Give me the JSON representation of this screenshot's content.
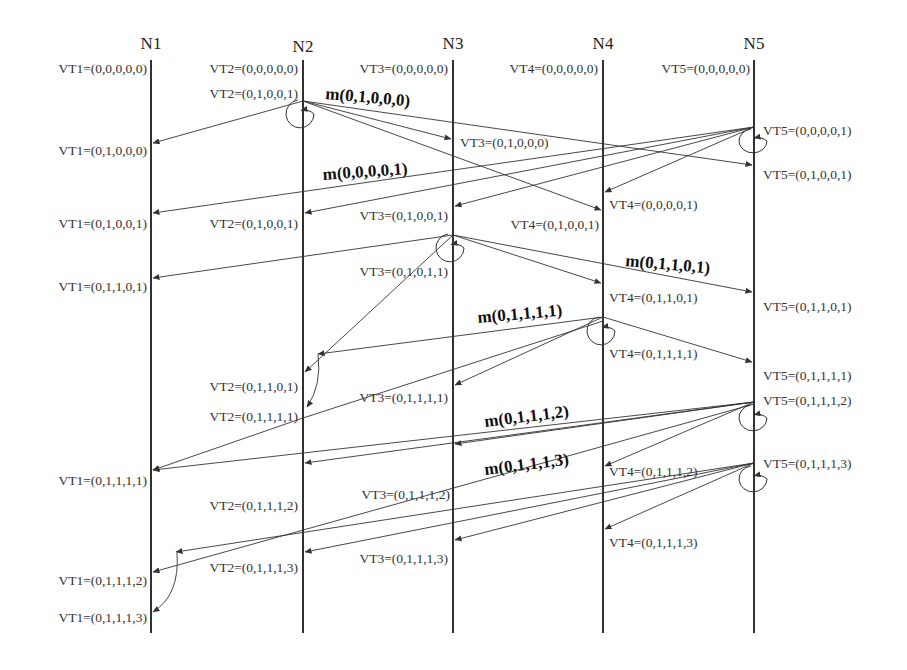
{
  "colors": {
    "line": "#1a1a1a",
    "arrow": "#333333",
    "text": "#333333",
    "background": "#ffffff"
  },
  "lifeline_top": 60,
  "lifeline_bottom": 633,
  "nodes": [
    {
      "id": "N1",
      "label": "N1",
      "x": 151,
      "label_y": 49
    },
    {
      "id": "N2",
      "label": "N2",
      "x": 303,
      "label_y": 52
    },
    {
      "id": "N3",
      "label": "N3",
      "x": 453,
      "label_y": 49
    },
    {
      "id": "N4",
      "label": "N4",
      "x": 603,
      "label_y": 49
    },
    {
      "id": "N5",
      "label": "N5",
      "x": 754,
      "label_y": 49
    }
  ],
  "vector_clock_labels": [
    {
      "node": "N1",
      "text": "VT1=(0,0,0,0,0)",
      "x": 147,
      "y": 73,
      "anchor": "end"
    },
    {
      "node": "N2",
      "text": "VT2=(0,0,0,0,0)",
      "x": 298,
      "y": 73,
      "anchor": "end"
    },
    {
      "node": "N3",
      "text": "VT3=(0,0,0,0,0)",
      "x": 448,
      "y": 73,
      "anchor": "end"
    },
    {
      "node": "N4",
      "text": "VT4=(0,0,0,0,0)",
      "x": 598,
      "y": 73,
      "anchor": "end"
    },
    {
      "node": "N5",
      "text": "VT5=(0,0,0,0,0)",
      "x": 750,
      "y": 73,
      "anchor": "end"
    },
    {
      "node": "N2",
      "text": "VT2=(0,1,0,0,1)",
      "x": 298,
      "y": 98,
      "anchor": "end"
    },
    {
      "node": "N1",
      "text": "VT1=(0,1,0,0,0)",
      "x": 147,
      "y": 155,
      "anchor": "end"
    },
    {
      "node": "N3",
      "text": "VT3=(0,1,0,0,0)",
      "x": 460,
      "y": 147,
      "anchor": "start"
    },
    {
      "node": "N5",
      "text": "VT5=(0,0,0,0,1)",
      "x": 763,
      "y": 135,
      "anchor": "start"
    },
    {
      "node": "N5",
      "text": "VT5=(0,1,0,0,1)",
      "x": 763,
      "y": 179,
      "anchor": "start"
    },
    {
      "node": "N4",
      "text": "VT4=(0,0,0,0,1)",
      "x": 609,
      "y": 209,
      "anchor": "start"
    },
    {
      "node": "N1",
      "text": "VT1=(0,1,0,0,1)",
      "x": 147,
      "y": 228,
      "anchor": "end"
    },
    {
      "node": "N2",
      "text": "VT2=(0,1,0,0,1)",
      "x": 298,
      "y": 228,
      "anchor": "end"
    },
    {
      "node": "N3",
      "text": "VT3=(0,1,0,0,1)",
      "x": 448,
      "y": 220,
      "anchor": "end"
    },
    {
      "node": "N4",
      "text": "VT4=(0,1,0,0,1)",
      "x": 599,
      "y": 229,
      "anchor": "end"
    },
    {
      "node": "N3",
      "text": "VT3=(0,1,0,1,1)",
      "x": 448,
      "y": 276,
      "anchor": "end"
    },
    {
      "node": "N1",
      "text": "VT1=(0,1,1,0,1)",
      "x": 147,
      "y": 291,
      "anchor": "end"
    },
    {
      "node": "N4",
      "text": "VT4=(0,1,1,0,1)",
      "x": 609,
      "y": 302,
      "anchor": "start"
    },
    {
      "node": "N5",
      "text": "VT5=(0,1,1,0,1)",
      "x": 763,
      "y": 311,
      "anchor": "start"
    },
    {
      "node": "N4",
      "text": "VT4=(0,1,1,1,1)",
      "x": 609,
      "y": 358,
      "anchor": "start"
    },
    {
      "node": "N5",
      "text": "VT5=(0,1,1,1,1)",
      "x": 763,
      "y": 380,
      "anchor": "start"
    },
    {
      "node": "N2",
      "text": "VT2=(0,1,1,0,1)",
      "x": 298,
      "y": 391,
      "anchor": "end"
    },
    {
      "node": "N5",
      "text": "VT5=(0,1,1,1,2)",
      "x": 763,
      "y": 405,
      "anchor": "start"
    },
    {
      "node": "N3",
      "text": "VT3=(0,1,1,1,1)",
      "x": 448,
      "y": 402,
      "anchor": "end"
    },
    {
      "node": "N2",
      "text": "VT2=(0,1,1,1,1)",
      "x": 298,
      "y": 421,
      "anchor": "end"
    },
    {
      "node": "N1",
      "text": "VT1=(0,1,1,1,1)",
      "x": 147,
      "y": 485,
      "anchor": "end"
    },
    {
      "node": "N4",
      "text": "VT4=(0,1,1,1,2)",
      "x": 609,
      "y": 476,
      "anchor": "start"
    },
    {
      "node": "N5",
      "text": "VT5=(0,1,1,1,3)",
      "x": 763,
      "y": 468,
      "anchor": "start"
    },
    {
      "node": "N3",
      "text": "VT3=(0,1,1,1,2)",
      "x": 450,
      "y": 499,
      "anchor": "end"
    },
    {
      "node": "N2",
      "text": "VT2=(0,1,1,1,2)",
      "x": 298,
      "y": 510,
      "anchor": "end"
    },
    {
      "node": "N4",
      "text": "VT4=(0,1,1,1,3)",
      "x": 609,
      "y": 547,
      "anchor": "start"
    },
    {
      "node": "N3",
      "text": "VT3=(0,1,1,1,3)",
      "x": 448,
      "y": 563,
      "anchor": "end"
    },
    {
      "node": "N2",
      "text": "VT2=(0,1,1,1,3)",
      "x": 298,
      "y": 572,
      "anchor": "end"
    },
    {
      "node": "N1",
      "text": "VT1=(0,1,1,1,2)",
      "x": 147,
      "y": 585,
      "anchor": "end"
    },
    {
      "node": "N1",
      "text": "VT1=(0,1,1,1,3)",
      "x": 147,
      "y": 622,
      "anchor": "end"
    }
  ],
  "message_labels": [
    {
      "text": "m(0,1,0,0,0)",
      "x": 325,
      "y": 99,
      "rotate": 5
    },
    {
      "text": "m(0,0,0,0,1)",
      "x": 323,
      "y": 180,
      "rotate": -4
    },
    {
      "text": "m(0,1,1,0,1)",
      "x": 625,
      "y": 266,
      "rotate": 5
    },
    {
      "text": "m(0,1,1,1,1)",
      "x": 478,
      "y": 323,
      "rotate": -5
    },
    {
      "text": "m(0,1,1,1,2)",
      "x": 485,
      "y": 427,
      "rotate": -7
    },
    {
      "text": "m(0,1,1,1,3)",
      "x": 485,
      "y": 475,
      "rotate": -7
    }
  ],
  "messages": [
    {
      "from": "N2",
      "to": "N1",
      "x1": 303,
      "y1": 101,
      "x2": 153,
      "y2": 143
    },
    {
      "from": "N2",
      "to": "N3",
      "x1": 303,
      "y1": 101,
      "x2": 451,
      "y2": 139
    },
    {
      "from": "N2",
      "to": "N4",
      "x1": 303,
      "y1": 101,
      "x2": 601,
      "y2": 210
    },
    {
      "from": "N2",
      "to": "N5",
      "x1": 303,
      "y1": 101,
      "x2": 752,
      "y2": 165
    },
    {
      "from": "N5",
      "to": "N1",
      "x1": 754,
      "y1": 127,
      "x2": 153,
      "y2": 213
    },
    {
      "from": "N5",
      "to": "N2",
      "x1": 754,
      "y1": 127,
      "x2": 305,
      "y2": 213
    },
    {
      "from": "N5",
      "to": "N3",
      "x1": 754,
      "y1": 127,
      "x2": 455,
      "y2": 206
    },
    {
      "from": "N5",
      "to": "N4",
      "x1": 754,
      "y1": 127,
      "x2": 605,
      "y2": 192
    },
    {
      "from": "N3",
      "to": "N1",
      "x1": 453,
      "y1": 235,
      "x2": 153,
      "y2": 278
    },
    {
      "from": "N3",
      "to": "N2",
      "x1": 453,
      "y1": 235,
      "x2": 305,
      "y2": 372
    },
    {
      "from": "N3",
      "to": "N4",
      "x1": 453,
      "y1": 235,
      "x2": 601,
      "y2": 283
    },
    {
      "from": "N3",
      "to": "N5",
      "x1": 453,
      "y1": 235,
      "x2": 752,
      "y2": 292
    },
    {
      "from": "N4",
      "to": "N2",
      "x1": 603,
      "y1": 317,
      "x2": 318,
      "y2": 354
    },
    {
      "from": "N4",
      "to": "N3",
      "x1": 603,
      "y1": 317,
      "x2": 455,
      "y2": 385
    },
    {
      "from": "N4",
      "to": "N5",
      "x1": 603,
      "y1": 317,
      "x2": 752,
      "y2": 362
    },
    {
      "from": "N4",
      "to": "N1",
      "x1": 603,
      "y1": 321,
      "x2": 303,
      "y2": 418,
      "continues_to": {
        "x": 153,
        "y": 470
      }
    },
    {
      "from": "N5",
      "to": "N1",
      "x1": 754,
      "y1": 402,
      "x2": 153,
      "y2": 470
    },
    {
      "from": "N5",
      "to": "N2",
      "x1": 754,
      "y1": 402,
      "x2": 305,
      "y2": 463
    },
    {
      "from": "N5",
      "to": "N3",
      "x1": 754,
      "y1": 402,
      "x2": 455,
      "y2": 444
    },
    {
      "from": "N5",
      "to": "N4",
      "x1": 754,
      "y1": 402,
      "x2": 605,
      "y2": 466
    },
    {
      "from": "N5",
      "to": "N1",
      "x1": 754,
      "y1": 404,
      "x2": 153,
      "y2": 572
    },
    {
      "from": "N5",
      "to": "N1",
      "x1": 754,
      "y1": 463,
      "x2": 176,
      "y2": 552
    },
    {
      "from": "N5",
      "to": "N2",
      "x1": 754,
      "y1": 463,
      "x2": 305,
      "y2": 552
    },
    {
      "from": "N5",
      "to": "N3",
      "x1": 754,
      "y1": 463,
      "x2": 455,
      "y2": 540
    },
    {
      "from": "N5",
      "to": "N4",
      "x1": 754,
      "y1": 463,
      "x2": 605,
      "y2": 529
    }
  ],
  "self_loops": [
    {
      "node": "N2",
      "cx": 300,
      "cy": 114,
      "rx": 14,
      "ry": 14
    },
    {
      "node": "N5",
      "cx": 753,
      "cy": 141,
      "rx": 14,
      "ry": 12
    },
    {
      "node": "N3",
      "cx": 450,
      "cy": 248,
      "rx": 14,
      "ry": 14
    },
    {
      "node": "N4",
      "cx": 601,
      "cy": 331,
      "rx": 14,
      "ry": 14
    },
    {
      "node": "N5",
      "cx": 753,
      "cy": 418,
      "rx": 14,
      "ry": 13
    },
    {
      "node": "N5",
      "cx": 753,
      "cy": 479,
      "rx": 14,
      "ry": 13
    }
  ],
  "delayed_deliveries": [
    {
      "node": "N2",
      "x1": 318,
      "y1": 354,
      "cx": 322,
      "cy": 385,
      "x2": 307,
      "y2": 407
    },
    {
      "node": "N1",
      "x1": 177,
      "y1": 553,
      "cx": 180,
      "cy": 595,
      "x2": 153,
      "y2": 612
    }
  ]
}
